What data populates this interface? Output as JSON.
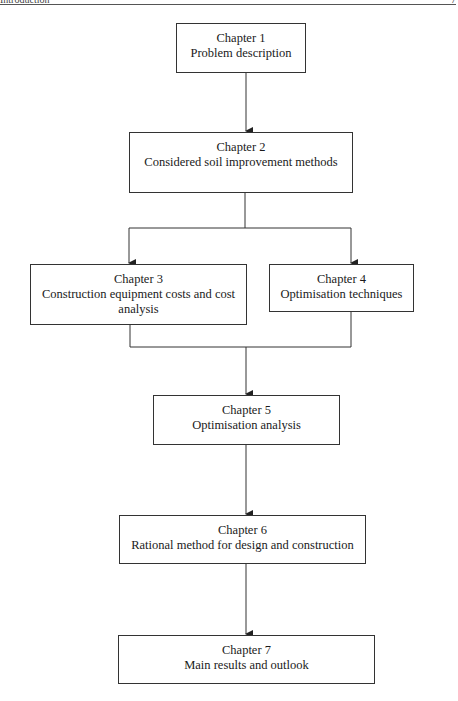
{
  "header": {
    "running_title": "Introduction",
    "page_number": "7"
  },
  "chapters": [
    {
      "chapter": "Chapter 1",
      "title": "Problem description"
    },
    {
      "chapter": "Chapter 2",
      "title": "Considered soil improvement methods"
    },
    {
      "chapter": "Chapter 3",
      "title": "Construction equipment costs and cost",
      "title_line2": "analysis"
    },
    {
      "chapter": "Chapter 4",
      "title": "Optimisation techniques"
    },
    {
      "chapter": "Chapter 5",
      "title": "Optimisation analysis"
    },
    {
      "chapter": "Chapter 6",
      "title": "Rational method for design and construction"
    },
    {
      "chapter": "Chapter 7",
      "title": "Main results and outlook"
    }
  ],
  "flow": [
    {
      "from": "Chapter 1",
      "to": "Chapter 2"
    },
    {
      "from": "Chapter 2",
      "to": "Chapter 3"
    },
    {
      "from": "Chapter 2",
      "to": "Chapter 4"
    },
    {
      "from": "Chapter 3",
      "to": "Chapter 5"
    },
    {
      "from": "Chapter 4",
      "to": "Chapter 5"
    },
    {
      "from": "Chapter 5",
      "to": "Chapter 6"
    },
    {
      "from": "Chapter 6",
      "to": "Chapter 7"
    }
  ]
}
